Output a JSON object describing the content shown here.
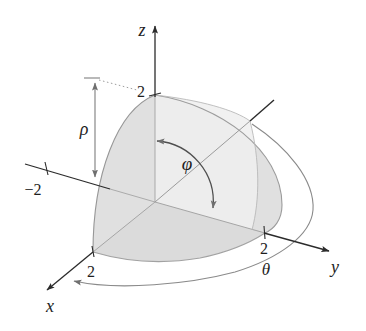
{
  "figure": {
    "axis_labels": {
      "z": "z",
      "y": "y",
      "x": "x"
    },
    "tick_labels": {
      "z": "2",
      "y": "2",
      "x": "2",
      "neg_y": "−2"
    },
    "symbol_labels": {
      "rho": "ρ",
      "phi": "φ",
      "theta": "θ"
    },
    "colors": {
      "background": "#ffffff",
      "axis": "#2b2b2b",
      "annotation": "#7d7d7d",
      "hidden_line": "#ababab",
      "outline": "#979797",
      "dome_fill": "#ededed",
      "base_shade": "rgba(0,0,0,0.075)",
      "left_wedge_shade": "rgba(0,0,0,0.05)",
      "right_sliver_shade": "rgba(0,0,0,0.055)"
    }
  }
}
